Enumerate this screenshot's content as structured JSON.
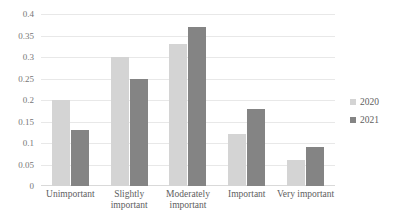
{
  "chart_data": {
    "type": "bar",
    "title": "",
    "xlabel": "",
    "ylabel": "",
    "categories": [
      "Unimportant",
      "Slightly important",
      "Moderately important",
      "Important",
      "Very important"
    ],
    "series": [
      {
        "name": "2020",
        "color": "#d4d4d4",
        "values": [
          0.2,
          0.3,
          0.33,
          0.12,
          0.06
        ]
      },
      {
        "name": "2021",
        "color": "#848484",
        "values": [
          0.13,
          0.25,
          0.37,
          0.18,
          0.09
        ]
      }
    ],
    "ylim": [
      0,
      0.4
    ],
    "ytick_values": [
      0,
      0.05,
      0.1,
      0.15,
      0.2,
      0.25,
      0.3,
      0.35,
      0.4
    ],
    "ytick_labels": [
      "0",
      "0.05",
      "0.1",
      "0.15",
      "0.2",
      "0.25",
      "0.3",
      "0.35",
      "0.4"
    ],
    "grid": true,
    "legend_position": "right"
  },
  "legend": {
    "entries": [
      {
        "label": "2020"
      },
      {
        "label": "2021"
      }
    ]
  }
}
